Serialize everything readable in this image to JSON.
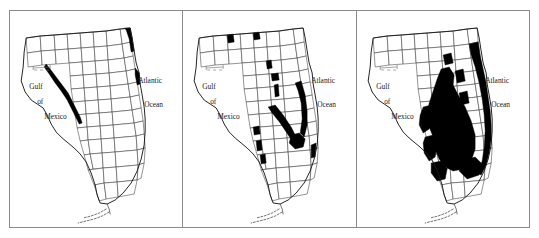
{
  "figure": {
    "type": "map-series",
    "panel_count": 3,
    "frame_color": "#8a8a8a",
    "shade_color": "#000000",
    "background_color": "#ffffff",
    "county_outline_color": "#3a3a3a"
  },
  "panels": [
    {
      "id": "panel-1",
      "order": 1,
      "shaded_extent": "narrow coastal strip along the northern Gulf coast and a short segment of the upper Atlantic coast",
      "labels": {
        "gulf_line1": "Gulf",
        "gulf_line2": "of",
        "gulf_line3": "Mexico",
        "atlantic_line1": "Atlantic",
        "atlantic_line2": "Ocean"
      }
    },
    {
      "id": "panel-2",
      "order": 2,
      "shaded_extent": "elongated north-south bands through the central peninsula plus scattered panhandle and southwest Gulf coast patches",
      "labels": {
        "gulf_line1": "Gulf",
        "gulf_line2": "of",
        "gulf_line3": "Mexico",
        "atlantic_line1": "Atlantic",
        "atlantic_line2": "Ocean"
      }
    },
    {
      "id": "panel-3",
      "order": 3,
      "shaded_extent": "extensive solid black coverage across most of the central and southern peninsula and the entire Atlantic coastal ridge",
      "labels": {
        "gulf_line1": "Gulf",
        "gulf_line2": "of",
        "gulf_line3": "Mexico",
        "atlantic_line1": "Atlantic",
        "atlantic_line2": "Ocean"
      }
    }
  ]
}
